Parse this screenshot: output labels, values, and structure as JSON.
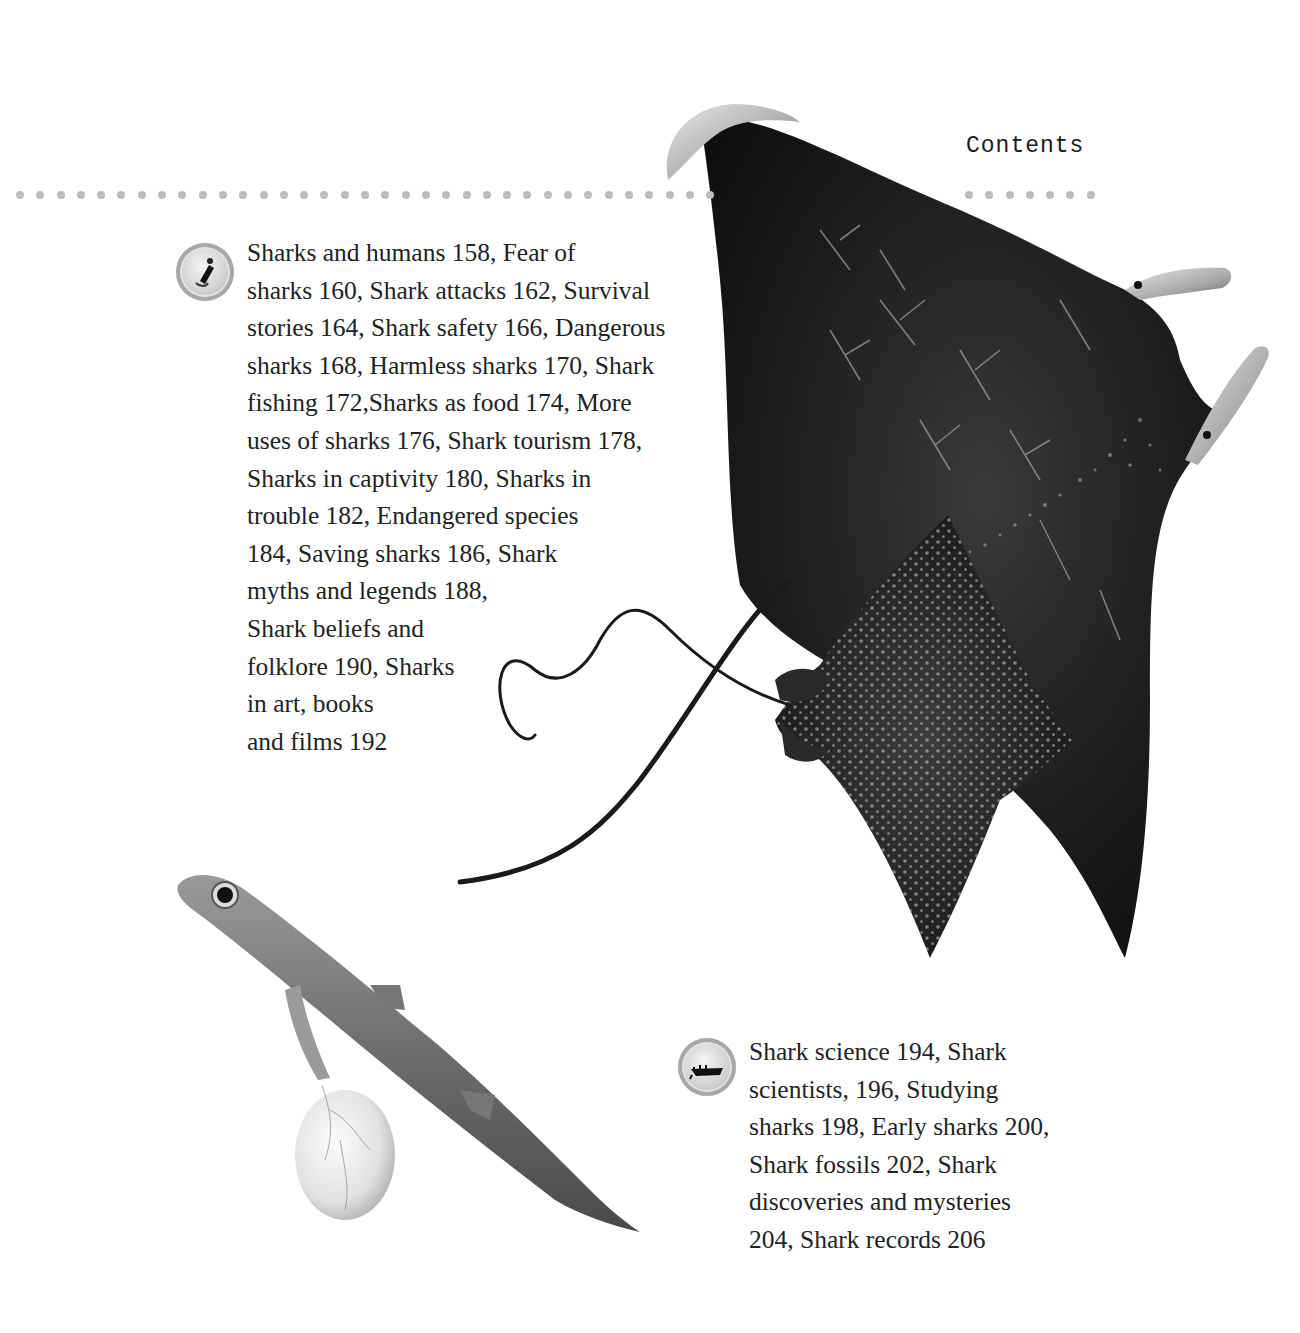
{
  "page": {
    "running_head": "Contents",
    "rule_color": "#bdbdbd",
    "text_color": "#222222"
  },
  "sections": [
    {
      "icon": "person-with-shark-badge-icon",
      "text": "Sharks and humans 158, Fear of\nsharks 160, Shark attacks 162, Survival\nstories 164, Shark safety 166, Dangerous\nsharks 168, Harmless sharks 170, Shark\nfishing 172,Sharks as food 174, More\nuses of sharks 176, Shark tourism 178,\nSharks in captivity 180, Sharks in\ntrouble 182, Endangered species\n184, Saving sharks 186, Shark\nmyths and legends 188,\nShark beliefs and\nfolklore 190, Sharks\nin art, books\n and films 192",
      "entries": [
        {
          "title": "Sharks and humans",
          "page": "158"
        },
        {
          "title": "Fear of sharks",
          "page": "160"
        },
        {
          "title": "Shark attacks",
          "page": "162"
        },
        {
          "title": "Survival stories",
          "page": "164"
        },
        {
          "title": "Shark safety",
          "page": "166"
        },
        {
          "title": "Dangerous sharks",
          "page": "168"
        },
        {
          "title": "Harmless sharks",
          "page": "170"
        },
        {
          "title": "Shark fishing",
          "page": "172"
        },
        {
          "title": "Sharks as food",
          "page": "174"
        },
        {
          "title": "More uses of sharks",
          "page": "176"
        },
        {
          "title": "Shark tourism",
          "page": "178"
        },
        {
          "title": "Sharks in captivity",
          "page": "180"
        },
        {
          "title": "Sharks in trouble",
          "page": "182"
        },
        {
          "title": "Endangered species",
          "page": "184"
        },
        {
          "title": "Saving sharks",
          "page": "186"
        },
        {
          "title": "Shark myths and legends",
          "page": "188"
        },
        {
          "title": "Shark beliefs and folklore",
          "page": "190"
        },
        {
          "title": "Sharks in art, books and films",
          "page": "192"
        }
      ]
    },
    {
      "icon": "boat-badge-icon",
      "text": "Shark science 194, Shark\nscientists, 196, Studying\nsharks 198, Early sharks 200,\nShark fossils 202, Shark\ndiscoveries and mysteries\n204, Shark records 206",
      "entries": [
        {
          "title": "Shark science",
          "page": "194"
        },
        {
          "title": "Shark scientists",
          "page": "196"
        },
        {
          "title": "Studying sharks",
          "page": "198"
        },
        {
          "title": "Early sharks",
          "page": "200"
        },
        {
          "title": "Shark fossils",
          "page": "202"
        },
        {
          "title": "Shark discoveries and mysteries",
          "page": "204"
        },
        {
          "title": "Shark records",
          "page": "206"
        }
      ]
    }
  ],
  "illustrations": [
    {
      "name": "manta-ray"
    },
    {
      "name": "spotted-eagle-ray"
    },
    {
      "name": "shark-embryo-with-yolk-sac"
    }
  ]
}
